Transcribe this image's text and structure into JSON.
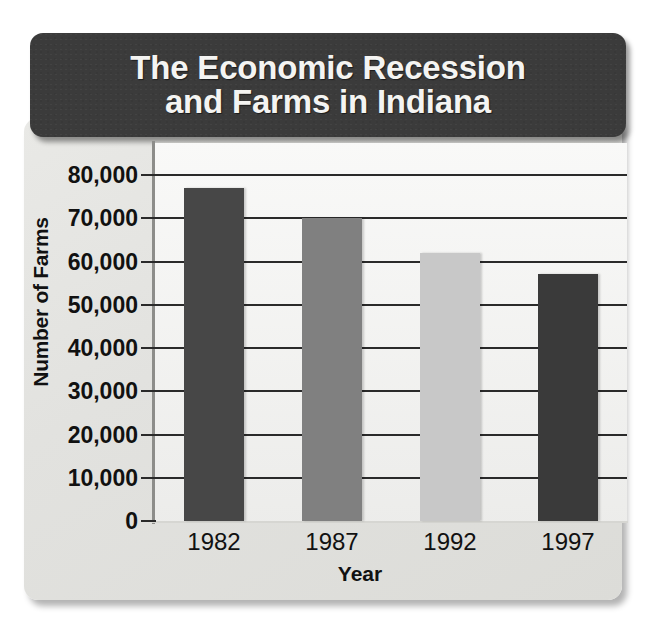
{
  "title": "The Economic Recession\nand Farms in Indiana",
  "axis": {
    "y_title": "Number of Farms",
    "x_title": "Year",
    "y_ticks": [
      "80,000",
      "70,000",
      "60,000",
      "50,000",
      "40,000",
      "30,000",
      "20,000",
      "10,000",
      "0"
    ]
  },
  "colors": {
    "title_plate": "#3b3b3b",
    "title_text": "#f4f4f2",
    "card_background": "#e4e4e1",
    "plot_background": "#f4f4f2",
    "gridline": "#2a2a2a",
    "axis_text": "#111111",
    "bar_1982": "#474747",
    "bar_1987": "#808080",
    "bar_1992": "#c8c8c8",
    "bar_1997": "#3a3a3a"
  },
  "chart_data": {
    "type": "bar",
    "title": "The Economic Recession and Farms in Indiana",
    "xlabel": "Year",
    "ylabel": "Number of Farms",
    "categories": [
      "1982",
      "1987",
      "1992",
      "1997"
    ],
    "values": [
      77000,
      70000,
      62000,
      57000
    ],
    "bar_colors": [
      "#474747",
      "#808080",
      "#c8c8c8",
      "#3a3a3a"
    ],
    "ylim": [
      0,
      80000
    ],
    "ytick_values": [
      0,
      10000,
      20000,
      30000,
      40000,
      50000,
      60000,
      70000,
      80000
    ],
    "ytick_labels": [
      "0",
      "10,000",
      "20,000",
      "30,000",
      "40,000",
      "50,000",
      "60,000",
      "70,000",
      "80,000"
    ],
    "grid": true,
    "grid_axis": "y",
    "legend": false,
    "legend_position": "none"
  }
}
